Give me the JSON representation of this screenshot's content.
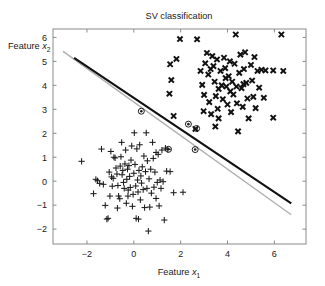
{
  "chart_data": {
    "type": "scatter",
    "title": "SV classification",
    "xlabel": "Feature x₁",
    "ylabel": "Feature x₂",
    "xlabel_parts": {
      "text": "Feature ",
      "var": "x",
      "sub": "1"
    },
    "ylabel_parts": {
      "text": "Feature ",
      "var": "x",
      "sub": "2"
    },
    "xlim": [
      -3.45,
      7.35
    ],
    "ylim": [
      -2.62,
      6.35
    ],
    "xticks": [
      -2,
      0,
      2,
      4,
      6
    ],
    "xticklabels": [
      "−2",
      "0",
      "2",
      "4",
      "6"
    ],
    "yticks": [
      -2,
      -1,
      0,
      1,
      2,
      3,
      4,
      5,
      6
    ],
    "yticklabels": [
      "−2",
      "−1",
      "0",
      "1",
      "2",
      "3",
      "4",
      "5",
      "6"
    ],
    "grid": false,
    "legend": null,
    "colors": {
      "background": "#ffffff",
      "axis": "#8a8a8a",
      "text": "#1a1a1a",
      "class_plus": "#1c1c1c",
      "class_cross": "#111111",
      "decision_boundary": "#101010",
      "secondary_boundary": "#b0b0b0",
      "support_vector_ring": "#1c1c1c"
    },
    "lines": [
      {
        "name": "decision-boundary",
        "style": "solid-thick-black",
        "color": "#101010",
        "width": 2.1,
        "points": [
          [
            -2.55,
            5.15
          ],
          [
            6.72,
            -0.92
          ]
        ]
      },
      {
        "name": "secondary-boundary",
        "style": "solid-thin-gray",
        "color": "#b0b0b0",
        "width": 1.5,
        "points": [
          [
            -3.02,
            5.42
          ],
          [
            6.72,
            -1.4
          ]
        ]
      }
    ],
    "series": [
      {
        "name": "class-plus",
        "marker": "plus",
        "label": "+",
        "color": "#1c1c1c",
        "points": [
          [
            -2.23,
            0.83
          ],
          [
            -1.72,
            -0.52
          ],
          [
            -1.55,
            0.02
          ],
          [
            -1.46,
            -0.09
          ],
          [
            -1.38,
            1.34
          ],
          [
            -1.3,
            -0.13
          ],
          [
            -1.22,
            -1.01
          ],
          [
            -1.15,
            -1.58
          ],
          [
            -1.1,
            -1.55
          ],
          [
            -1.05,
            0.38
          ],
          [
            -1.02,
            -0.62
          ],
          [
            -0.98,
            1.24
          ],
          [
            -0.95,
            0.18
          ],
          [
            -0.92,
            -0.21
          ],
          [
            -0.88,
            0.12
          ],
          [
            -0.85,
            1.0
          ],
          [
            -0.8,
            0.97
          ],
          [
            -0.76,
            0.55
          ],
          [
            -0.72,
            0.3
          ],
          [
            -0.68,
            -0.18
          ],
          [
            -0.65,
            -0.62
          ],
          [
            -0.6,
            -0.73
          ],
          [
            -0.58,
            0.63
          ],
          [
            -0.55,
            1.02
          ],
          [
            -0.52,
            1.62
          ],
          [
            -0.5,
            0.27
          ],
          [
            -0.47,
            0.45
          ],
          [
            -0.44,
            -0.05
          ],
          [
            -0.41,
            -0.3
          ],
          [
            -0.38,
            0.72
          ],
          [
            -0.35,
            1.3
          ],
          [
            -0.32,
            -0.92
          ],
          [
            -0.3,
            0.08
          ],
          [
            -0.27,
            0.5
          ],
          [
            -0.24,
            -0.37
          ],
          [
            -0.21,
            0.65
          ],
          [
            -0.18,
            0.2
          ],
          [
            -0.15,
            -0.26
          ],
          [
            -0.12,
            0.88
          ],
          [
            -0.09,
            1.47
          ],
          [
            -0.06,
            -1.05
          ],
          [
            -0.03,
            -0.55
          ],
          [
            0.0,
            0.33
          ],
          [
            0.02,
            2.02
          ],
          [
            0.05,
            0.7
          ],
          [
            0.08,
            -0.2
          ],
          [
            0.1,
            -1.55
          ],
          [
            0.13,
            1.35
          ],
          [
            0.16,
            0.05
          ],
          [
            0.18,
            -0.45
          ],
          [
            0.22,
            0.45
          ],
          [
            0.25,
            1.52
          ],
          [
            0.28,
            -0.78
          ],
          [
            0.3,
            0.22
          ],
          [
            0.33,
            -0.08
          ],
          [
            0.36,
            0.6
          ],
          [
            0.4,
            -0.35
          ],
          [
            0.43,
            1.05
          ],
          [
            0.46,
            -1.1
          ],
          [
            0.5,
            0.4
          ],
          [
            0.53,
            2.02
          ],
          [
            0.56,
            -0.3
          ],
          [
            0.58,
            0.85
          ],
          [
            0.62,
            -2.08
          ],
          [
            0.65,
            0.1
          ],
          [
            0.68,
            -1.08
          ],
          [
            0.72,
            0.5
          ],
          [
            0.75,
            -0.5
          ],
          [
            0.8,
            1.62
          ],
          [
            0.83,
            0.95
          ],
          [
            0.86,
            -0.25
          ],
          [
            0.9,
            0.38
          ],
          [
            0.95,
            -0.72
          ],
          [
            1.0,
            -0.05
          ],
          [
            1.04,
            1.12
          ],
          [
            1.08,
            -1.03
          ],
          [
            1.12,
            0.05
          ],
          [
            1.16,
            -0.3
          ],
          [
            1.2,
            1.3
          ],
          [
            1.25,
            -0.02
          ],
          [
            1.3,
            -1.62
          ],
          [
            1.35,
            1.38
          ],
          [
            1.4,
            0.42
          ],
          [
            1.45,
            1.33
          ],
          [
            1.55,
            0.4
          ],
          [
            1.7,
            -0.48
          ],
          [
            2.1,
            -0.46
          ],
          [
            -1.62,
            0.08
          ],
          [
            -0.7,
            -1.12
          ],
          [
            0.2,
            -1.58
          ],
          [
            0.95,
            1.2
          ],
          [
            -0.25,
            -0.62
          ]
        ]
      },
      {
        "name": "class-cross",
        "marker": "cross-bold",
        "label": "×",
        "color": "#111111",
        "points": [
          [
            1.97,
            5.93
          ],
          [
            1.55,
            4.88
          ],
          [
            1.82,
            5.1
          ],
          [
            1.6,
            4.22
          ],
          [
            1.52,
            3.65
          ],
          [
            1.7,
            2.72
          ],
          [
            2.63,
            2.18
          ],
          [
            2.7,
            5.92
          ],
          [
            2.85,
            4.6
          ],
          [
            2.92,
            4.02
          ],
          [
            3.0,
            3.6
          ],
          [
            3.05,
            4.92
          ],
          [
            3.12,
            5.35
          ],
          [
            3.18,
            4.45
          ],
          [
            3.22,
            3.3
          ],
          [
            3.3,
            2.8
          ],
          [
            3.35,
            5.22
          ],
          [
            3.4,
            4.8
          ],
          [
            3.45,
            4.15
          ],
          [
            3.5,
            3.55
          ],
          [
            3.55,
            5.08
          ],
          [
            3.58,
            3.02
          ],
          [
            3.62,
            2.62
          ],
          [
            3.7,
            4.6
          ],
          [
            3.75,
            4.0
          ],
          [
            3.8,
            3.42
          ],
          [
            3.85,
            5.15
          ],
          [
            3.9,
            4.72
          ],
          [
            3.95,
            3.95
          ],
          [
            4.0,
            3.2
          ],
          [
            4.05,
            4.38
          ],
          [
            4.1,
            5.0
          ],
          [
            4.15,
            2.88
          ],
          [
            4.2,
            4.15
          ],
          [
            4.25,
            3.62
          ],
          [
            4.3,
            4.9
          ],
          [
            4.35,
            6.12
          ],
          [
            4.4,
            3.25
          ],
          [
            4.45,
            2.08
          ],
          [
            4.5,
            4.52
          ],
          [
            4.55,
            5.28
          ],
          [
            4.6,
            3.88
          ],
          [
            4.65,
            3.1
          ],
          [
            4.7,
            4.68
          ],
          [
            4.75,
            5.38
          ],
          [
            4.8,
            4.1
          ],
          [
            4.85,
            3.45
          ],
          [
            4.9,
            2.62
          ],
          [
            5.0,
            4.85
          ],
          [
            5.05,
            4.2
          ],
          [
            5.1,
            3.52
          ],
          [
            5.15,
            5.18
          ],
          [
            5.2,
            3.05
          ],
          [
            5.28,
            4.6
          ],
          [
            5.35,
            3.9
          ],
          [
            5.45,
            4.65
          ],
          [
            5.55,
            3.48
          ],
          [
            5.62,
            4.62
          ],
          [
            5.95,
            4.62
          ],
          [
            6.38,
            4.6
          ],
          [
            6.3,
            6.12
          ],
          [
            5.95,
            2.65
          ],
          [
            3.28,
            4.68
          ],
          [
            3.92,
            4.3
          ],
          [
            4.12,
            3.75
          ],
          [
            4.38,
            3.95
          ],
          [
            3.62,
            3.85
          ],
          [
            4.68,
            4.05
          ],
          [
            2.98,
            2.92
          ],
          [
            3.48,
            2.28
          ]
        ]
      },
      {
        "name": "support-vectors",
        "marker": "circled-dot",
        "color": "#1c1c1c",
        "points": [
          [
            0.32,
            2.92
          ],
          [
            2.33,
            2.38
          ],
          [
            2.62,
            1.32
          ],
          [
            1.48,
            1.33
          ],
          [
            2.68,
            2.2
          ]
        ]
      }
    ]
  }
}
